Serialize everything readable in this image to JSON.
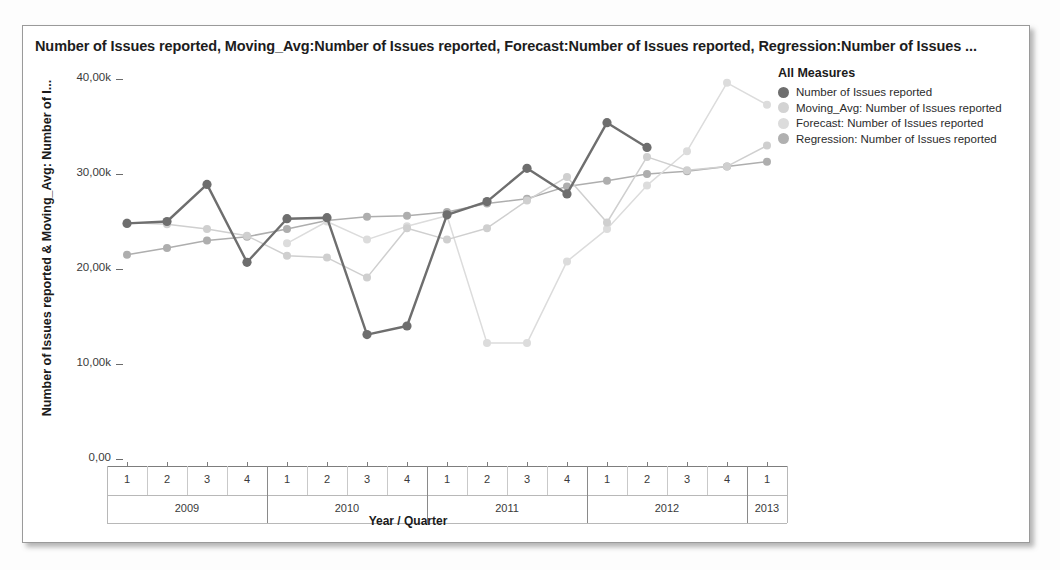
{
  "chart_title": "Number of Issues reported, Moving_Avg:Number of Issues reported, Forecast:Number of Issues reported, Regression:Number of Issues ...",
  "legend": {
    "title": "All Measures",
    "items": [
      {
        "label": "Number of Issues reported",
        "color": "#6e6e6e"
      },
      {
        "label": "Moving_Avg: Number of Issues reported",
        "color": "#d3d3d3"
      },
      {
        "label": "Forecast: Number of Issues reported",
        "color": "#dcdcdc"
      },
      {
        "label": "Regression: Number of Issues reported",
        "color": "#b0b0b0"
      }
    ]
  },
  "chart_data": {
    "type": "line",
    "title": "Number of Issues reported, Moving_Avg:Number of Issues reported, Forecast:Number of Issues reported, Regression:Number of Issues ...",
    "xlabel": "Year / Quarter",
    "ylabel": "Number of Issues reported & Moving_Avg: Number of I...",
    "ylim": [
      0,
      40000
    ],
    "yticks": [
      0,
      10000,
      20000,
      30000,
      40000
    ],
    "ytick_labels": [
      "0,00",
      "10,00k",
      "20,00k",
      "30,00k",
      "40,00k"
    ],
    "grid": false,
    "legend_position": "right",
    "x": [
      "2009 Q1",
      "2009 Q2",
      "2009 Q3",
      "2009 Q4",
      "2010 Q1",
      "2010 Q2",
      "2010 Q3",
      "2010 Q4",
      "2011 Q1",
      "2011 Q2",
      "2011 Q3",
      "2011 Q4",
      "2012 Q1",
      "2012 Q2",
      "2012 Q3",
      "2012 Q4",
      "2013 Q1"
    ],
    "quarters": [
      "1",
      "2",
      "3",
      "4",
      "1",
      "2",
      "3",
      "4",
      "1",
      "2",
      "3",
      "4",
      "1",
      "2",
      "3",
      "4",
      "1"
    ],
    "year_groups": [
      {
        "year": "2009",
        "quarters": [
          "1",
          "2",
          "3",
          "4"
        ]
      },
      {
        "year": "2010",
        "quarters": [
          "1",
          "2",
          "3",
          "4"
        ]
      },
      {
        "year": "2011",
        "quarters": [
          "1",
          "2",
          "3",
          "4"
        ]
      },
      {
        "year": "2012",
        "quarters": [
          "1",
          "2",
          "3",
          "4"
        ]
      },
      {
        "year": "2013",
        "quarters": [
          "1"
        ]
      }
    ],
    "series": [
      {
        "name": "Number of Issues reported",
        "color": "#6e6e6e",
        "values": [
          24800,
          25000,
          28900,
          20700,
          25300,
          25400,
          13100,
          14000,
          25700,
          27100,
          30600,
          27900,
          35400,
          32800,
          null,
          null,
          null
        ]
      },
      {
        "name": "Moving_Avg: Number of Issues reported",
        "color": "#cfcfcf",
        "values": [
          24900,
          24700,
          24200,
          23500,
          21400,
          21200,
          19100,
          24300,
          23100,
          24300,
          27200,
          29700,
          24900,
          31800,
          30400,
          30800,
          33000
        ]
      },
      {
        "name": "Forecast: Number of Issues reported",
        "color": "#dcdcdc",
        "values": [
          null,
          null,
          null,
          null,
          22700,
          25000,
          23100,
          24500,
          25600,
          12200,
          12200,
          20800,
          24200,
          28800,
          32400,
          39600,
          37300
        ]
      },
      {
        "name": "Regression: Number of Issues reported",
        "color": "#aeaeae",
        "values": [
          21500,
          22200,
          23000,
          23400,
          24200,
          25100,
          25500,
          25600,
          26000,
          26900,
          27400,
          28700,
          29300,
          30000,
          30300,
          30800,
          31300
        ]
      }
    ]
  }
}
